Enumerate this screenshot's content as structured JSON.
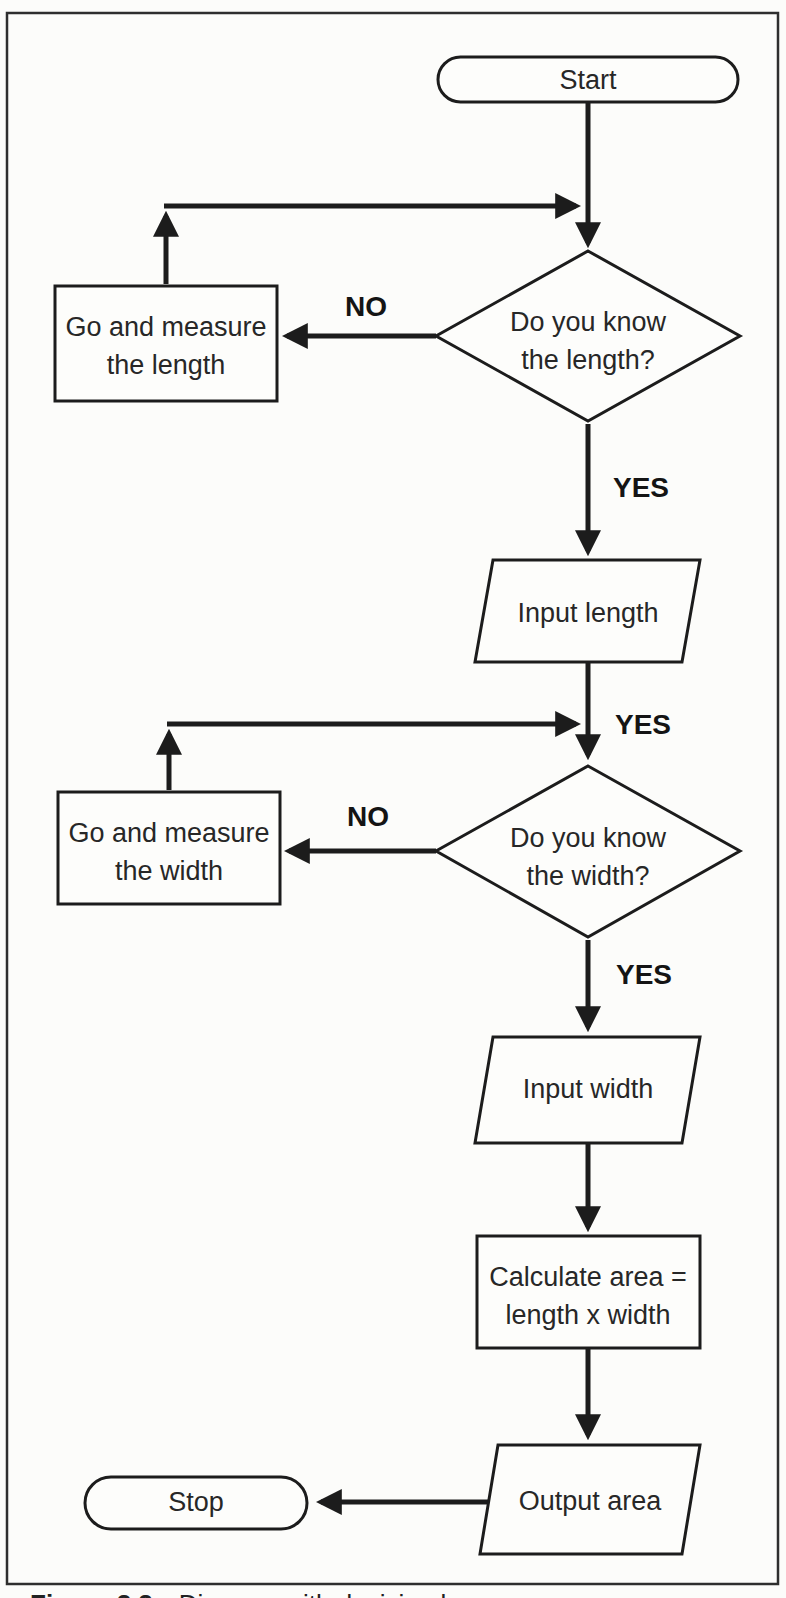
{
  "diagram": {
    "nodes": {
      "start": {
        "type": "terminator",
        "label": "Start"
      },
      "decision_length": {
        "type": "decision",
        "line1": "Do you know",
        "line2": "the length?"
      },
      "measure_length": {
        "type": "process",
        "line1": "Go and measure",
        "line2": "the length"
      },
      "input_length": {
        "type": "input",
        "label": "Input length"
      },
      "decision_width": {
        "type": "decision",
        "line1": "Do you know",
        "line2": "the width?"
      },
      "measure_width": {
        "type": "process",
        "line1": "Go and measure",
        "line2": "the width"
      },
      "input_width": {
        "type": "input",
        "label": "Input width"
      },
      "calculate_area": {
        "type": "process",
        "line1": "Calculate area =",
        "line2": "length x width"
      },
      "output_area": {
        "type": "output",
        "label": "Output area"
      },
      "stop": {
        "type": "terminator",
        "label": "Stop"
      }
    },
    "edge_labels": {
      "no_length": "NO",
      "yes_length": "YES",
      "yes_junction": "YES",
      "no_width": "NO",
      "yes_width": "YES"
    },
    "caption": {
      "figure_label": "Figure 2.2",
      "text": "Diagram with decision boxes"
    },
    "colors": {
      "ink": "#1c1c1c",
      "paper": "#fcfcfa"
    }
  }
}
